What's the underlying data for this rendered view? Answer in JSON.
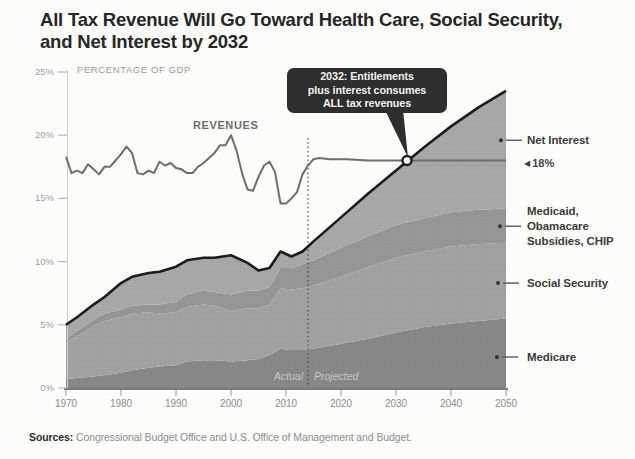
{
  "header": {
    "title_lines": [
      "All Tax Revenue Will Go Toward  Health Care, Social Security,",
      "and Net Interest by 2032"
    ]
  },
  "chart_data": {
    "type": "area",
    "title": "All Tax Revenue Will Go Toward Health Care, Social Security, and Net Interest by 2032",
    "unit_label": "PERCENTAGE OF GDP",
    "ylabel": "Percentage of GDP",
    "ylim": [
      0,
      25
    ],
    "xlim": [
      1970,
      2050
    ],
    "grid": false,
    "ytick_labels": [
      "25%",
      "20%",
      "15%",
      "10%",
      "5%",
      "0%"
    ],
    "ytick_values": [
      25,
      20,
      15,
      10,
      5,
      0
    ],
    "xtick_labels": [
      "1970",
      "1980",
      "1990",
      "2000",
      "2010",
      "2020",
      "2030",
      "2040",
      "2050"
    ],
    "xtick_values": [
      1970,
      1980,
      1990,
      2000,
      2010,
      2020,
      2030,
      2040,
      2050
    ],
    "divider": {
      "year": 2014,
      "left_label": "Actual",
      "right_label": "Projected"
    },
    "stack_years": [
      1970,
      1972,
      1975,
      1977,
      1980,
      1982,
      1985,
      1987,
      1990,
      1992,
      1995,
      1997,
      2000,
      2003,
      2005,
      2007,
      2009,
      2011,
      2013,
      2015,
      2020,
      2025,
      2030,
      2035,
      2040,
      2045,
      2050
    ],
    "stack_series": [
      {
        "name": "Medicare",
        "values": [
          0.7,
          0.8,
          0.9,
          1.0,
          1.2,
          1.4,
          1.6,
          1.7,
          1.8,
          2.1,
          2.2,
          2.2,
          2.1,
          2.2,
          2.3,
          2.6,
          3.1,
          3.0,
          3.0,
          3.1,
          3.5,
          3.9,
          4.4,
          4.8,
          5.1,
          5.3,
          5.5
        ]
      },
      {
        "name": "Social Security",
        "values": [
          2.9,
          3.3,
          4.0,
          4.3,
          4.4,
          4.5,
          4.4,
          4.2,
          4.2,
          4.3,
          4.4,
          4.3,
          4.0,
          4.1,
          4.0,
          4.0,
          4.8,
          4.8,
          4.9,
          5.0,
          5.3,
          5.7,
          5.9,
          6.0,
          6.1,
          6.1,
          6.0
        ]
      },
      {
        "name": "Medicaid, Obamacare Subsidies, CHIP",
        "values": [
          0.3,
          0.4,
          0.5,
          0.6,
          0.6,
          0.6,
          0.6,
          0.7,
          0.8,
          1.0,
          1.1,
          1.1,
          1.3,
          1.4,
          1.4,
          1.4,
          1.6,
          1.7,
          1.9,
          2.0,
          2.3,
          2.4,
          2.6,
          2.6,
          2.7,
          2.7,
          2.7
        ]
      },
      {
        "name": "Net Interest",
        "values": [
          1.1,
          1.1,
          1.2,
          1.3,
          2.1,
          2.3,
          2.5,
          2.6,
          2.8,
          2.7,
          2.6,
          2.7,
          3.1,
          2.2,
          1.6,
          1.5,
          1.3,
          0.9,
          1.0,
          1.5,
          2.4,
          3.4,
          4.3,
          5.6,
          6.8,
          8.1,
          9.3
        ]
      }
    ],
    "line_series": {
      "name": "REVENUES",
      "points": [
        [
          1970,
          18.3
        ],
        [
          1971,
          17.0
        ],
        [
          1972,
          17.2
        ],
        [
          1973,
          17.0
        ],
        [
          1974,
          17.7
        ],
        [
          1975,
          17.3
        ],
        [
          1976,
          16.9
        ],
        [
          1977,
          17.5
        ],
        [
          1978,
          17.5
        ],
        [
          1979,
          18.0
        ],
        [
          1980,
          18.5
        ],
        [
          1981,
          19.1
        ],
        [
          1982,
          18.6
        ],
        [
          1983,
          17.0
        ],
        [
          1984,
          16.9
        ],
        [
          1985,
          17.2
        ],
        [
          1986,
          17.0
        ],
        [
          1987,
          17.9
        ],
        [
          1988,
          17.6
        ],
        [
          1989,
          17.8
        ],
        [
          1990,
          17.4
        ],
        [
          1991,
          17.3
        ],
        [
          1992,
          17.0
        ],
        [
          1993,
          17.0
        ],
        [
          1994,
          17.5
        ],
        [
          1995,
          17.8
        ],
        [
          1996,
          18.2
        ],
        [
          1997,
          18.6
        ],
        [
          1998,
          19.2
        ],
        [
          1999,
          19.2
        ],
        [
          2000,
          20.0
        ],
        [
          2001,
          18.8
        ],
        [
          2002,
          17.0
        ],
        [
          2003,
          15.7
        ],
        [
          2004,
          15.6
        ],
        [
          2005,
          16.7
        ],
        [
          2006,
          17.6
        ],
        [
          2007,
          17.9
        ],
        [
          2008,
          17.1
        ],
        [
          2009,
          14.6
        ],
        [
          2010,
          14.6
        ],
        [
          2011,
          15.0
        ],
        [
          2012,
          15.5
        ],
        [
          2013,
          16.9
        ],
        [
          2014,
          17.6
        ],
        [
          2015,
          18.1
        ],
        [
          2016,
          18.2
        ],
        [
          2018,
          18.1
        ],
        [
          2021,
          18.1
        ],
        [
          2025,
          18.0
        ],
        [
          2030,
          18.0
        ],
        [
          2035,
          18.0
        ],
        [
          2040,
          18.0
        ],
        [
          2045,
          18.0
        ],
        [
          2050,
          18.0
        ]
      ]
    },
    "annotation": {
      "text": "2032: Entitlements\nplus interest consumes\nALL tax revenues",
      "marker_year": 2032,
      "marker_value": 18,
      "arrow_glyph": "◀",
      "marker_label": "18%"
    },
    "legend_position": "right",
    "legend": [
      {
        "label": "Net Interest",
        "pct": 19.6
      },
      {
        "label": "Medicaid,\nObamacare\nSubsidies, CHIP",
        "pct": 12.8
      },
      {
        "label": "Social Security",
        "pct": 8.3
      },
      {
        "label": "Medicare",
        "pct": 2.45
      }
    ]
  },
  "footer": {
    "sources_label": "Sources:",
    "sources_text": " Congressional Budget Office and U.S. Office of Management and Budget."
  },
  "colors": {
    "background": "#fcfcfa",
    "medicare": "#888888",
    "social_security": "#a3a3a3",
    "medicaid": "#979797",
    "net_interest": "#a9a9a9",
    "total_line": "#1c1c1c",
    "revenues_line": "#6e6e6e",
    "divider_line": "#4a4a4a",
    "callout_bg": "#2e2e2e",
    "callout_text": "#f2f2f2",
    "axis_line": "#4f4f4f",
    "tick_line": "#b0b0b0"
  }
}
